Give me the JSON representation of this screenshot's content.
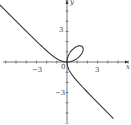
{
  "chart_data": {
    "type": "line",
    "title": "",
    "xlabel": "x",
    "ylabel": "y",
    "x_ticks": [
      -3,
      0,
      3
    ],
    "y_ticks": [
      3,
      -3
    ],
    "xlim": [
      -6.5,
      6.3
    ],
    "ylim": [
      -6.2,
      6.2
    ],
    "grid": false,
    "series": [
      {
        "name": "folium x^3+y^3=3xy",
        "equation": "x^3 + y^3 = 3xy",
        "color": "#333333"
      }
    ]
  },
  "labels": {
    "x_axis": "x",
    "y_axis": "y",
    "tick_neg3_x": "−3",
    "tick_0": "0",
    "tick_3_x": "3",
    "tick_3_y": "3",
    "tick_neg3_y": "−3"
  }
}
